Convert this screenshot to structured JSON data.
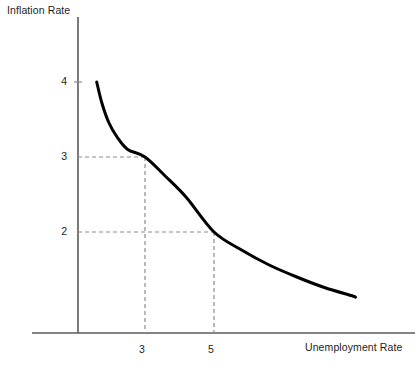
{
  "chart_data": {
    "type": "line",
    "title": "",
    "xlabel": "Unemployment Rate",
    "ylabel": "Inflation Rate",
    "ylabel_position": "top-left",
    "xlabel_position": "bottom-right",
    "grid": false,
    "legend": null,
    "x_ticks": [
      "3",
      "5"
    ],
    "x_tick_values": [
      3,
      5
    ],
    "y_ticks": [
      "4",
      "3",
      "2"
    ],
    "y_tick_values": [
      4,
      3,
      2
    ],
    "xlim": [
      0,
      9.8
    ],
    "ylim": [
      0,
      5.1
    ],
    "series": [
      {
        "name": "Phillips Curve",
        "x": [
          1.6,
          1.75,
          1.95,
          2.2,
          2.5,
          3.0,
          3.6,
          4.2,
          5.0,
          5.8,
          6.6,
          7.4,
          8.2,
          9.0,
          9.1
        ],
        "y": [
          4.0,
          3.72,
          3.46,
          3.26,
          3.1,
          3.0,
          2.74,
          2.46,
          2.0,
          1.76,
          1.56,
          1.4,
          1.26,
          1.15,
          1.13
        ],
        "color": "#000000",
        "style": "solid",
        "width": 3
      }
    ],
    "annotations": [
      {
        "type": "guide-lines",
        "point": {
          "x": 3,
          "y": 3
        },
        "style": "dashed",
        "color": "#8c8c8c"
      },
      {
        "type": "guide-lines",
        "point": {
          "x": 5,
          "y": 2
        },
        "style": "dashed",
        "color": "#8c8c8c"
      }
    ],
    "axis_color": "#5a5a5a",
    "curve_color": "#000000",
    "guide_color": "#8c8c8c",
    "background": "#ffffff"
  },
  "labels": {
    "y_axis_title": "Inflation Rate",
    "x_axis_title": "Unemployment Rate",
    "y_tick_4": "4",
    "y_tick_3": "3",
    "y_tick_2": "2",
    "x_tick_3": "3",
    "x_tick_5": "5"
  }
}
